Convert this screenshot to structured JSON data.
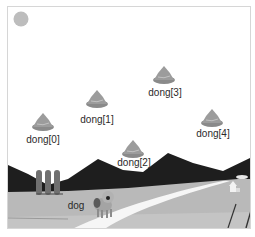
{
  "stage": {
    "background": "#ffffff",
    "border_color": "#d6d6d6"
  },
  "sun": {
    "icon": "sun-icon",
    "color": "#bdbdbd"
  },
  "scenery": {
    "mountain_color": "#1e1e1e",
    "field_color": "#b9b9b9",
    "field_light_color": "#c9c9c9",
    "road_color": "#f4f4f4",
    "silo_color": "#6e6e6e"
  },
  "sprites": {
    "dongs": [
      {
        "label": "dong[0]",
        "icon": "poop-icon"
      },
      {
        "label": "dong[1]",
        "icon": "poop-icon"
      },
      {
        "label": "dong[2]",
        "icon": "poop-icon"
      },
      {
        "label": "dong[3]",
        "icon": "poop-icon"
      },
      {
        "label": "dong[4]",
        "icon": "poop-icon"
      }
    ],
    "dog": {
      "label": "dog",
      "icon": "dog-icon"
    }
  }
}
